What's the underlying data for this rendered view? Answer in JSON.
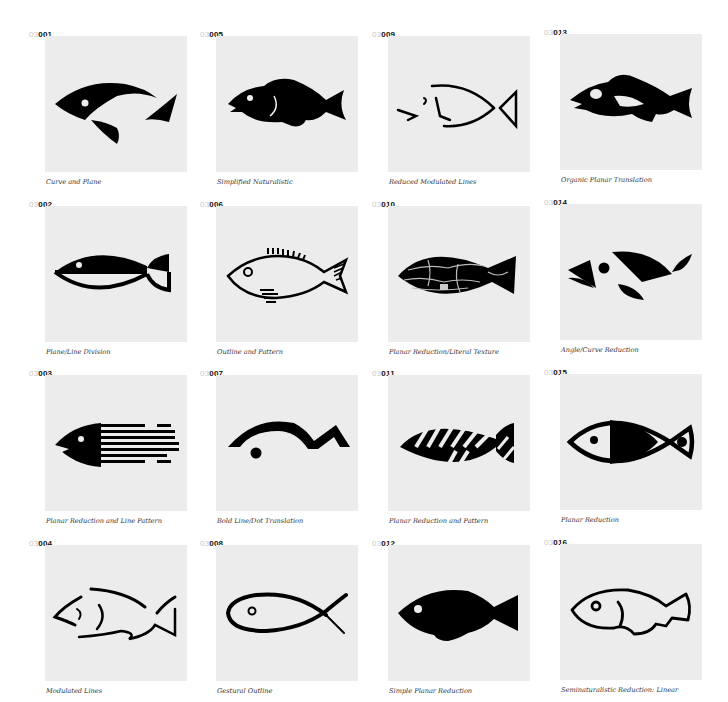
{
  "page": {
    "prefix": "03",
    "items": [
      {
        "id": "001",
        "caption": "Curve and Plane",
        "icon": "fish-curve-and-plane"
      },
      {
        "id": "002",
        "caption": "Plane/Line Division",
        "icon": "fish-plane-line-division"
      },
      {
        "id": "003",
        "caption": "Planar Reduction and Line Pattern",
        "icon": "fish-line-pattern"
      },
      {
        "id": "004",
        "caption": "Modulated Lines",
        "icon": "fish-modulated-lines"
      },
      {
        "id": "005",
        "caption": "Simplified Naturalistic",
        "icon": "fish-simplified-naturalistic"
      },
      {
        "id": "006",
        "caption": "Outline and Pattern",
        "icon": "fish-outline-pattern"
      },
      {
        "id": "007",
        "caption": "Bold Line/Dot Translation",
        "icon": "fish-bold-line-dot"
      },
      {
        "id": "008",
        "caption": "Gestural Outline",
        "icon": "fish-gestural-outline"
      },
      {
        "id": "009",
        "caption": "Reduced Modulated Lines",
        "icon": "fish-reduced-modulated-lines"
      },
      {
        "id": "010",
        "caption": "Planar Reduction/Literal Texture",
        "icon": "fish-literal-texture"
      },
      {
        "id": "011",
        "caption": "Planar Reduction and Pattern",
        "icon": "fish-planar-pattern"
      },
      {
        "id": "012",
        "caption": "Simple Planar Reduction",
        "icon": "fish-simple-planar"
      },
      {
        "id": "013",
        "caption": "Organic Planar Translation",
        "icon": "fish-organic-planar"
      },
      {
        "id": "014",
        "caption": "Angle/Curve Reduction",
        "icon": "fish-angle-curve"
      },
      {
        "id": "015",
        "caption": "Planar Reduction",
        "icon": "fish-planar-reduction"
      },
      {
        "id": "016",
        "caption": "Seminaturalistic Reduction: Linear",
        "icon": "fish-seminaturalistic-linear"
      }
    ]
  }
}
